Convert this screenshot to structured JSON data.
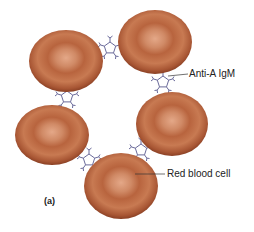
{
  "diagram": {
    "panel_label": "(a)",
    "labels": {
      "igm": "Anti-A IgM",
      "rbc": "Red blood cell"
    },
    "cells": [
      {
        "id": "rbc-top-left",
        "cx": 66,
        "cy": 61,
        "rx": 37,
        "ry": 31
      },
      {
        "id": "rbc-top-right",
        "cx": 155,
        "cy": 42,
        "rx": 37,
        "ry": 32
      },
      {
        "id": "rbc-mid-left",
        "cx": 52,
        "cy": 135,
        "rx": 37,
        "ry": 30
      },
      {
        "id": "rbc-mid-right",
        "cx": 172,
        "cy": 124,
        "rx": 36,
        "ry": 32
      },
      {
        "id": "rbc-bottom",
        "cx": 121,
        "cy": 186,
        "rx": 37,
        "ry": 33
      }
    ],
    "antibodies": [
      {
        "id": "igm-1",
        "x": 110,
        "y": 48
      },
      {
        "id": "igm-2",
        "x": 163,
        "y": 82
      },
      {
        "id": "igm-3",
        "x": 67,
        "y": 97
      },
      {
        "id": "igm-4",
        "x": 141,
        "y": 150
      },
      {
        "id": "igm-5",
        "x": 89,
        "y": 160
      }
    ],
    "colors": {
      "cell_edge": "#9a4a2a",
      "cell_mid": "#c0704a",
      "cell_center": "#e0a080",
      "antibody": "#6a6a9a",
      "text": "#222222"
    }
  }
}
